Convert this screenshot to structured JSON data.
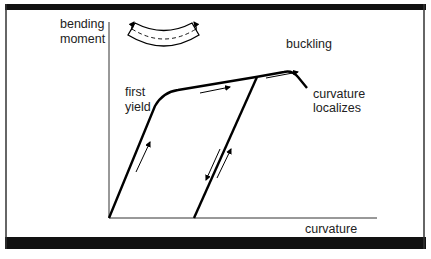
{
  "figure": {
    "type": "moment-curvature diagram",
    "y_axis_label_line1": "bending",
    "y_axis_label_line2": "moment",
    "x_axis_label": "curvature",
    "annotations": {
      "first_yield_line1": "first",
      "first_yield_line2": "yield",
      "buckling": "buckling",
      "localizes_line1": "curvature",
      "localizes_line2": "localizes"
    },
    "inset": "bent-beam-icon",
    "colors": {
      "frame": "#111111",
      "line": "#000000",
      "axis": "#333333",
      "text": "#222222"
    }
  }
}
